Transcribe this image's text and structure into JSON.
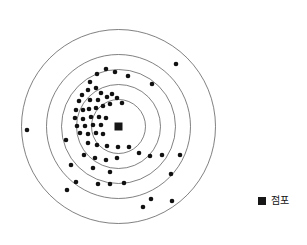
{
  "chart_data": {
    "type": "scatter",
    "title": "",
    "subtitle": "",
    "xlabel": "",
    "ylabel": "",
    "grid": "concentric-rings",
    "legend_position": "bottom-right",
    "center": {
      "x": 118.5,
      "y": 126.5,
      "marker": "filled-square",
      "size": 8,
      "color": "#161616"
    },
    "rings": [
      {
        "index": 1,
        "radius": 27
      },
      {
        "index": 2,
        "radius": 42
      },
      {
        "index": 3,
        "radius": 57
      },
      {
        "index": 4,
        "radius": 72
      },
      {
        "index": 5,
        "radius": 97
      }
    ],
    "ring_color": "#4a4a4a",
    "point_color": "#111111",
    "point_radius": 2.3,
    "series": [
      {
        "name": "점포",
        "marker": "filled-circle",
        "color": "#111111",
        "points": [
          {
            "x": 27,
            "y": 130
          },
          {
            "x": 176,
            "y": 64
          },
          {
            "x": 152,
            "y": 84
          },
          {
            "x": 128,
            "y": 76
          },
          {
            "x": 115,
            "y": 72
          },
          {
            "x": 106,
            "y": 69
          },
          {
            "x": 97,
            "y": 74
          },
          {
            "x": 90,
            "y": 82
          },
          {
            "x": 88,
            "y": 90
          },
          {
            "x": 96,
            "y": 88
          },
          {
            "x": 101,
            "y": 93
          },
          {
            "x": 82,
            "y": 95
          },
          {
            "x": 79,
            "y": 101
          },
          {
            "x": 90,
            "y": 100
          },
          {
            "x": 98,
            "y": 100
          },
          {
            "x": 107,
            "y": 97
          },
          {
            "x": 112,
            "y": 94
          },
          {
            "x": 117,
            "y": 98
          },
          {
            "x": 122,
            "y": 103
          },
          {
            "x": 110,
            "y": 104
          },
          {
            "x": 103,
            "y": 106
          },
          {
            "x": 96,
            "y": 108
          },
          {
            "x": 89,
            "y": 109
          },
          {
            "x": 83,
            "y": 110
          },
          {
            "x": 76,
            "y": 110
          },
          {
            "x": 75,
            "y": 118
          },
          {
            "x": 83,
            "y": 119
          },
          {
            "x": 91,
            "y": 117
          },
          {
            "x": 99,
            "y": 117
          },
          {
            "x": 106,
            "y": 118
          },
          {
            "x": 77,
            "y": 126
          },
          {
            "x": 85,
            "y": 126
          },
          {
            "x": 93,
            "y": 125
          },
          {
            "x": 101,
            "y": 125
          },
          {
            "x": 80,
            "y": 133
          },
          {
            "x": 88,
            "y": 134
          },
          {
            "x": 96,
            "y": 133
          },
          {
            "x": 103,
            "y": 134
          },
          {
            "x": 66,
            "y": 140
          },
          {
            "x": 88,
            "y": 143
          },
          {
            "x": 97,
            "y": 145
          },
          {
            "x": 107,
            "y": 146
          },
          {
            "x": 118,
            "y": 147
          },
          {
            "x": 129,
            "y": 147
          },
          {
            "x": 139,
            "y": 153
          },
          {
            "x": 150,
            "y": 156
          },
          {
            "x": 162,
            "y": 155
          },
          {
            "x": 180,
            "y": 155
          },
          {
            "x": 84,
            "y": 155
          },
          {
            "x": 95,
            "y": 158
          },
          {
            "x": 106,
            "y": 160
          },
          {
            "x": 117,
            "y": 158
          },
          {
            "x": 71,
            "y": 165
          },
          {
            "x": 93,
            "y": 168
          },
          {
            "x": 110,
            "y": 172
          },
          {
            "x": 171,
            "y": 174
          },
          {
            "x": 76,
            "y": 182
          },
          {
            "x": 98,
            "y": 184
          },
          {
            "x": 110,
            "y": 184
          },
          {
            "x": 124,
            "y": 183
          },
          {
            "x": 67,
            "y": 190
          },
          {
            "x": 151,
            "y": 199
          },
          {
            "x": 172,
            "y": 201
          },
          {
            "x": 143,
            "y": 207
          }
        ]
      }
    ],
    "legend": [
      {
        "label": "점포",
        "marker": "filled-square",
        "color": "#161616"
      }
    ]
  },
  "legend": {
    "store_label": "점포"
  }
}
